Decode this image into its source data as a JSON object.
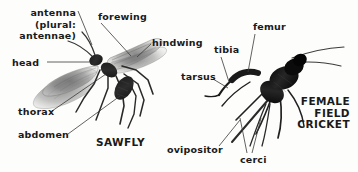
{
  "figure": {
    "background_color": "#fdfdfb",
    "text_color": "#1a1a1a",
    "leader_line_color": "#3a3a3a",
    "type": "labeled-anatomy-diagram",
    "specimens": [
      {
        "id": "sawfly",
        "caption": "SAWFLY",
        "description": "photograph of a sawfly with translucent gray wings spread, body oriented diagonally"
      },
      {
        "id": "field-cricket",
        "caption": "FEMALE\nFIELD\nCRICKET",
        "description": "photograph of a dark black female field cricket with long antennae and ovipositor"
      }
    ]
  },
  "labels": {
    "antenna": "antenna\n(plural:\nantennae)",
    "forewing": "forewing",
    "hindwing": "hindwing",
    "head": "head",
    "thorax": "thorax",
    "abdomen": "abdomen",
    "sawfly": "SAWFLY",
    "femur": "femur",
    "tibia": "tibia",
    "tarsus": "tarsus",
    "ovipositor": "ovipositor",
    "cerci": "cerci",
    "cricket": "FEMALE\nFIELD\nCRICKET"
  }
}
